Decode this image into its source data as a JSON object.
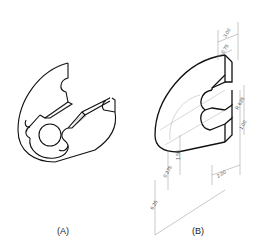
{
  "figures": [
    {
      "id": "A",
      "caption": "(A)"
    },
    {
      "id": "B",
      "caption": "(B)",
      "dimensions": [
        "3.00",
        "0.75",
        "R.625",
        "1.00",
        "0.375",
        "1.50",
        "6.25",
        "2.00"
      ]
    }
  ],
  "colors": {
    "line": "#111111",
    "dim_line": "#777777",
    "background": "#ffffff"
  }
}
